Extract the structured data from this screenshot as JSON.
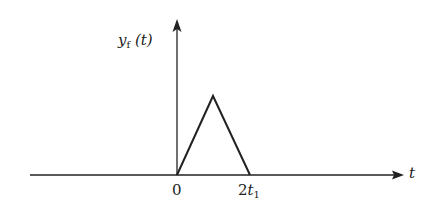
{
  "diagram": {
    "type": "signal-waveform",
    "y_axis_label": {
      "var": "y",
      "sub": "f",
      "arg": "(t)"
    },
    "x_axis_label": "t",
    "ticks": [
      {
        "label_coef": "0",
        "label_var": "",
        "label_sub": ""
      },
      {
        "label_coef": "2",
        "label_var": "t",
        "label_sub": "1"
      }
    ],
    "waveform": {
      "shape": "triangle",
      "start": "0",
      "peak_at": "t1",
      "end": "2t1"
    },
    "colors": {
      "stroke": "#222222",
      "background": "#ffffff"
    }
  }
}
